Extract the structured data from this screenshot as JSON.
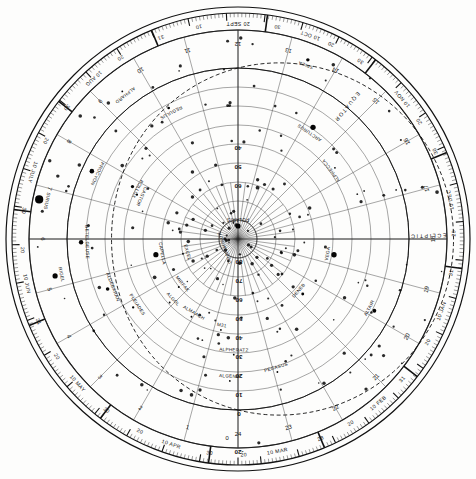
{
  "chart_data": {
    "type": "scatter",
    "projection": "polar / azimuthal equidistant, north celestial pole at centre",
    "xlabel": "Right Ascension (hours)",
    "ylabel": "Declination (degrees)",
    "grid": true,
    "legend": "none",
    "center_label": "POLARIS",
    "center_sublabel": "URSA MINOR",
    "dec_range": [
      -20,
      90
    ],
    "dec_ticks": [
      -20,
      0,
      10,
      20,
      30,
      40,
      50,
      60,
      70,
      80,
      90
    ],
    "dec_tick_labels": [
      "-20",
      "0",
      "10",
      "20",
      "30",
      "40",
      "50",
      "60",
      "70",
      "80",
      "90"
    ],
    "ra_range": [
      0,
      24
    ],
    "ra_ticks": [
      1,
      2,
      3,
      4,
      5,
      6,
      7,
      8,
      9,
      10,
      11,
      12,
      13,
      14,
      15,
      16,
      17,
      18,
      19,
      20,
      21,
      22,
      23,
      24
    ],
    "ra_tick_labels": [
      "1",
      "2",
      "3",
      "4",
      "5",
      "6",
      "7",
      "8",
      "9",
      "10",
      "11",
      "12",
      "13",
      "14",
      "15",
      "16",
      "17",
      "18",
      "19",
      "20",
      "21",
      "22",
      "23",
      "24"
    ],
    "curves": [
      {
        "name": "ECLIPTIC",
        "style": "dashed",
        "label": "ECLIPTIC"
      },
      {
        "name": "EQUATOR",
        "style": "solid",
        "label": "EQUATOR"
      }
    ],
    "stars": [
      {
        "name": "VEGA",
        "ra": 18.62,
        "dec": 38.8,
        "mag": 0.0
      },
      {
        "name": "ALTAIR",
        "ra": 19.85,
        "dec": 8.9,
        "mag": 0.8
      },
      {
        "name": "DENEB",
        "ra": 20.69,
        "dec": 45.3,
        "mag": 1.3
      },
      {
        "name": "ARCTURUS",
        "ra": 14.26,
        "dec": 19.2,
        "mag": 0.0
      },
      {
        "name": "ANTARES",
        "ra": 16.49,
        "dec": -26.4,
        "mag": 1.0
      },
      {
        "name": "SPICA",
        "ra": 13.42,
        "dec": -11.2,
        "mag": 1.0
      },
      {
        "name": "REGULUS",
        "ra": 10.14,
        "dec": 12.0,
        "mag": 1.4
      },
      {
        "name": "ALPHARD",
        "ra": 9.46,
        "dec": -8.7,
        "mag": 2.0
      },
      {
        "name": "POLLUX",
        "ra": 7.76,
        "dec": 28.0,
        "mag": 1.1
      },
      {
        "name": "CASTOR",
        "ra": 7.58,
        "dec": 31.9,
        "mag": 1.6
      },
      {
        "name": "PROCYON",
        "ra": 7.66,
        "dec": 5.2,
        "mag": 0.4
      },
      {
        "name": "SIRIUS",
        "ra": 6.75,
        "dec": -16.7,
        "mag": -1.5
      },
      {
        "name": "BETELGEUSE",
        "ra": 5.92,
        "dec": 7.4,
        "mag": 0.5
      },
      {
        "name": "RIGEL",
        "ra": 5.24,
        "dec": -8.2,
        "mag": 0.1
      },
      {
        "name": "ALDEBARAN",
        "ra": 4.6,
        "dec": 16.5,
        "mag": 0.9
      },
      {
        "name": "CAPELLA",
        "ra": 5.28,
        "dec": 46.0,
        "mag": 0.1
      },
      {
        "name": "PLEIADES",
        "ra": 3.79,
        "dec": 24.1,
        "mag": 1.6
      },
      {
        "name": "ALGOL",
        "ra": 3.14,
        "dec": 40.9,
        "mag": 2.1
      },
      {
        "name": "MIRFAK",
        "ra": 3.4,
        "dec": 49.9,
        "mag": 1.8
      },
      {
        "name": "ALMAACH",
        "ra": 2.06,
        "dec": 42.3,
        "mag": 2.1
      },
      {
        "name": "ALPHECCA",
        "ra": 15.58,
        "dec": 26.7,
        "mag": 2.2
      },
      {
        "name": "M31",
        "ra": 0.71,
        "dec": 41.3,
        "mag": 3.4
      },
      {
        "name": "ALPHERATZ",
        "ra": 0.14,
        "dec": 29.1,
        "mag": 2.1
      },
      {
        "name": "ALGENIB",
        "ra": 0.22,
        "dec": 15.2,
        "mag": 2.8
      },
      {
        "name": "PEGASUS",
        "ra": 22.9,
        "dec": 17.0,
        "mag": 2.5
      },
      {
        "name": "EXCEL",
        "ra": 5.0,
        "dec": 60.0,
        "mag": 3.0
      }
    ],
    "month_scale": [
      {
        "label": "20 SEPT",
        "ra_position": 12.0
      },
      {
        "label": "10",
        "ra_position": 11.3
      },
      {
        "label": "30",
        "ra_position": 12.7
      },
      {
        "label": "10 OCT",
        "ra_position": 13.3
      },
      {
        "label": "20",
        "ra_position": 13.7
      },
      {
        "label": "30",
        "ra_position": 14.3
      },
      {
        "label": "10 NOV",
        "ra_position": 15.3
      },
      {
        "label": "20",
        "ra_position": 15.8
      },
      {
        "label": "30",
        "ra_position": 16.4
      },
      {
        "label": "10 DEC",
        "ra_position": 17.3
      },
      {
        "label": "20",
        "ra_position": 17.9
      },
      {
        "label": "31",
        "ra_position": 18.6
      },
      {
        "label": "10 JAN",
        "ra_position": 19.3
      },
      {
        "label": "20",
        "ra_position": 19.9
      },
      {
        "label": "31",
        "ra_position": 20.7
      },
      {
        "label": "10 FEB",
        "ra_position": 21.3
      },
      {
        "label": "20",
        "ra_position": 21.9
      },
      {
        "label": "28",
        "ra_position": 22.5
      },
      {
        "label": "10 MAR",
        "ra_position": 23.3
      },
      {
        "label": "20",
        "ra_position": 23.9
      },
      {
        "label": "30",
        "ra_position": 0.5
      },
      {
        "label": "10 APR",
        "ra_position": 1.2
      },
      {
        "label": "20",
        "ra_position": 1.8
      },
      {
        "label": "30",
        "ra_position": 2.5
      },
      {
        "label": "10 MAY",
        "ra_position": 3.2
      },
      {
        "label": "20",
        "ra_position": 3.8
      },
      {
        "label": "31",
        "ra_position": 4.5
      },
      {
        "label": "10 JUN",
        "ra_position": 5.2
      },
      {
        "label": "20",
        "ra_position": 5.8
      },
      {
        "label": "30",
        "ra_position": 6.5
      },
      {
        "label": "10 JULY",
        "ra_position": 7.2
      },
      {
        "label": "20",
        "ra_position": 7.8
      },
      {
        "label": "30",
        "ra_position": 8.5
      },
      {
        "label": "10 AUG",
        "ra_position": 9.2
      },
      {
        "label": "20",
        "ra_position": 9.8
      },
      {
        "label": "31",
        "ra_position": 10.6
      }
    ],
    "months": [
      "SEPT",
      "OCT",
      "NOV",
      "DEC",
      "JAN",
      "FEB",
      "MAR",
      "APR",
      "MAY",
      "JUN",
      "JULY",
      "AUG"
    ]
  },
  "colors": {
    "ink": "#111111",
    "grid": "#3a3a3a",
    "paper": "#fdfdfc",
    "star": "#050505"
  }
}
